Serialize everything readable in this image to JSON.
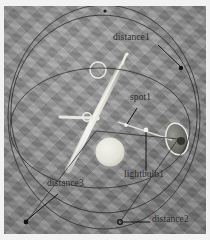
{
  "scene": {
    "kind": "annotated-photo-diagram",
    "subject": "ceiling light fixture with geometric overlay",
    "background_color": "#8e8e8e",
    "frame_color": "#f2f2f2",
    "annotation_color": "#1d1d1d",
    "highlight_color": "#e8e8e4",
    "header_text": ""
  },
  "annotations": [
    {
      "id": "distance1",
      "label": "distance1",
      "label_x": 113,
      "label_y": 38,
      "leader": "M 158 45 L 181 67",
      "marker_x": 181,
      "marker_y": 68,
      "marker_type": "dot"
    },
    {
      "id": "spot1",
      "label": "spot1",
      "label_x": 130,
      "label_y": 98,
      "leader": "M 137 108 L 127 124",
      "marker_x": 126,
      "marker_y": 125,
      "marker_type": "dot"
    },
    {
      "id": "lightbulb1",
      "label": "lightbulb1",
      "label_x": 124,
      "label_y": 175,
      "leader": "M 146 171 L 146 130",
      "marker_x": 146,
      "marker_y": 130,
      "marker_type": "dot"
    },
    {
      "id": "distance3",
      "label": "distance3",
      "label_x": 47,
      "label_y": 184,
      "leader": "M 58 194 L 27 221",
      "marker_x": 26,
      "marker_y": 222,
      "marker_type": "dot"
    },
    {
      "id": "distance2",
      "label": "distance2",
      "label_x": 153,
      "label_y": 218,
      "leader": "M 150 222 L 122 222",
      "marker_x": 120,
      "marker_y": 222,
      "marker_type": "ring"
    }
  ],
  "overlay_geometry": {
    "circles": [
      {
        "name": "outer-circle",
        "cx": 104,
        "cy": 117,
        "rx": 96,
        "ry": 112
      },
      {
        "name": "tilted-circle",
        "cx": 104,
        "cy": 114,
        "rx": 93,
        "ry": 99,
        "rotate": -8
      },
      {
        "name": "inner-ellipse",
        "cx": 100,
        "cy": 128,
        "rx": 90,
        "ry": 60
      }
    ],
    "chords": [
      {
        "name": "chord-upper-right",
        "d": "M 96 131 L 178 139"
      },
      {
        "name": "chord-lower-left",
        "d": "M 27 221 L 96 131"
      },
      {
        "name": "chord-bottom",
        "d": "M 120 222 L 178 139"
      }
    ],
    "top_marker": {
      "cx": 105,
      "cy": 11
    }
  },
  "fixture": {
    "pole": {
      "name": "fluorescent-tube",
      "x1": 122,
      "y1": 64,
      "x2": 68,
      "y2": 170,
      "width": 6
    },
    "tip": {
      "name": "pole-tip",
      "x1": 124,
      "y1": 58,
      "x2": 122,
      "y2": 64
    },
    "arm": {
      "name": "side-arm",
      "x1": 60,
      "y1": 117,
      "x2": 92,
      "y2": 119,
      "width": 3
    },
    "joint_ring": {
      "name": "joint-ring",
      "cx": 88,
      "cy": 117,
      "r": 4
    },
    "hub": {
      "name": "center-hub",
      "cx": 97,
      "cy": 117,
      "r": 2.5
    },
    "small_ring": {
      "name": "small-ring",
      "cx": 98,
      "cy": 70,
      "r": 8
    },
    "dome": {
      "name": "bright-dome",
      "cx": 110,
      "cy": 152,
      "r": 14
    },
    "shade": {
      "name": "lamp-shade-arc",
      "cx": 177,
      "cy": 139,
      "rx": 11,
      "ry": 16,
      "rotate": -12
    },
    "shade_core": {
      "cx": 180,
      "cy": 141,
      "r": 4
    },
    "bulb_dot": {
      "name": "bulb-dot",
      "cx": 146,
      "cy": 130,
      "r": 2.4
    },
    "ray": {
      "name": "light-ray",
      "x1": 122,
      "y1": 123,
      "x2": 172,
      "y2": 140
    }
  }
}
